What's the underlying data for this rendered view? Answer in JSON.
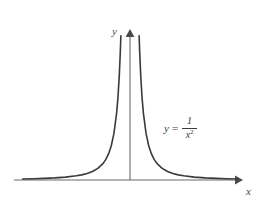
{
  "figure": {
    "background_color": "#ffffff",
    "width": 263,
    "height": 210
  },
  "axes": {
    "x_label": "x",
    "y_label": "y",
    "axis_color": "#6b6b6b",
    "origin": {
      "x": 130,
      "y": 180
    },
    "x_axis": {
      "start_x": 14,
      "end_x": 240,
      "y": 180,
      "arrow": "right"
    },
    "y_axis": {
      "x": 130,
      "start_y": 180,
      "end_y": 30,
      "arrow": "up"
    }
  },
  "equation": {
    "lhs": "y",
    "relation": "=",
    "numerator": "1",
    "denominator_base": "x",
    "denominator_exponent": "2",
    "plain_text": "y = 1/x^2",
    "color": "#3c3c3c"
  },
  "curve": {
    "color": "#3a3a3a",
    "stroke_width": 1.6,
    "description": "even reciprocal-square curve, symmetric about the y-axis, asymptotic to both axes"
  },
  "chart_data": {
    "type": "line",
    "title": "",
    "xlabel": "x",
    "ylabel": "y",
    "legend": [
      "y = 1/x^2"
    ],
    "grid": false,
    "xlim": [
      -4.1,
      4.1
    ],
    "ylim": [
      0,
      9
    ],
    "annotations": [
      {
        "text": "y = 1/x^2",
        "x": 1.6,
        "y": 2.6
      }
    ],
    "series": [
      {
        "name": "y = 1/x^2",
        "x": [
          -4.0,
          -3.6,
          -3.2,
          -2.8,
          -2.4,
          -2.0,
          -1.8,
          -1.6,
          -1.4,
          -1.2,
          -1.0,
          -0.9,
          -0.8,
          -0.7,
          -0.6,
          -0.5,
          -0.45,
          -0.4,
          -0.36,
          -0.34,
          0.34,
          0.36,
          0.4,
          0.45,
          0.5,
          0.6,
          0.7,
          0.8,
          0.9,
          1.0,
          1.2,
          1.4,
          1.6,
          1.8,
          2.0,
          2.4,
          2.8,
          3.2,
          3.6,
          4.0
        ],
        "y": [
          0.063,
          0.077,
          0.098,
          0.128,
          0.174,
          0.25,
          0.309,
          0.391,
          0.51,
          0.694,
          1.0,
          1.235,
          1.563,
          2.041,
          2.778,
          4.0,
          4.938,
          6.25,
          7.716,
          8.651,
          8.651,
          7.716,
          6.25,
          4.938,
          4.0,
          2.778,
          2.041,
          1.563,
          1.235,
          1.0,
          0.694,
          0.51,
          0.391,
          0.309,
          0.25,
          0.174,
          0.128,
          0.098,
          0.077,
          0.063
        ]
      }
    ]
  }
}
